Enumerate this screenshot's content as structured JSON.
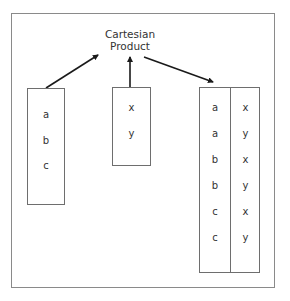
{
  "title": {
    "line1": "Cartesian",
    "line2": "Product"
  },
  "set_a": {
    "items": [
      "a",
      "b",
      "c"
    ]
  },
  "set_b": {
    "items": [
      "x",
      "y"
    ]
  },
  "result": {
    "left_column": [
      "a",
      "a",
      "b",
      "b",
      "c",
      "c"
    ],
    "right_column": [
      "x",
      "y",
      "x",
      "y",
      "x",
      "y"
    ]
  },
  "colors": {
    "arrow": "#1a1a1a",
    "border": "#6e6e6e",
    "frame": "#8a8a8a"
  }
}
